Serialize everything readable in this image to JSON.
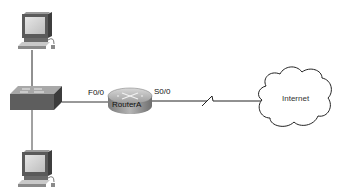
{
  "diagram": {
    "type": "network-topology",
    "nodes": [
      {
        "id": "pc-top",
        "kind": "pc"
      },
      {
        "id": "switch",
        "kind": "switch"
      },
      {
        "id": "pc-bottom",
        "kind": "pc"
      },
      {
        "id": "router",
        "kind": "router",
        "label": "RouterA"
      },
      {
        "id": "internet",
        "kind": "cloud",
        "label": "Internet"
      }
    ],
    "links": [
      {
        "from": "pc-top",
        "to": "switch",
        "type": "ethernet"
      },
      {
        "from": "pc-bottom",
        "to": "switch",
        "type": "ethernet"
      },
      {
        "from": "switch",
        "to": "router",
        "type": "ethernet",
        "interface_label": "F0/0"
      },
      {
        "from": "router",
        "to": "internet",
        "type": "serial",
        "interface_label": "S0/0"
      }
    ]
  },
  "labels": {
    "router": "RouterA",
    "cloud": "Internet",
    "fa_interface": "F0/0",
    "serial_interface": "S0/0"
  }
}
